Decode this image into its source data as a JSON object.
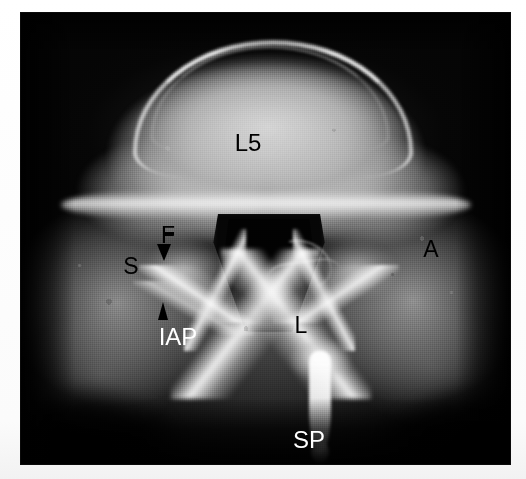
{
  "figure": {
    "kind": "axial-radiograph",
    "plate": {
      "background_color": "#050505",
      "page_color": "#ffffff",
      "left": 21,
      "top": 13,
      "width": 489,
      "height": 451
    }
  },
  "labels": [
    {
      "id": "l5",
      "text": "L5",
      "color": "#000000",
      "x": 248,
      "y": 143,
      "font_size": 24,
      "anchor": "center",
      "meaning": "fifth lumbar vertebral body"
    },
    {
      "id": "f",
      "text": "F",
      "color": "#000000",
      "x": 168,
      "y": 235,
      "font_size": 23,
      "anchor": "center",
      "meaning": "facet joint"
    },
    {
      "id": "s",
      "text": "S",
      "color": "#000000",
      "x": 131,
      "y": 266,
      "font_size": 23,
      "anchor": "center",
      "meaning": "superior articular process"
    },
    {
      "id": "a",
      "text": "A",
      "color": "#000000",
      "x": 431,
      "y": 249,
      "font_size": 23,
      "anchor": "center",
      "meaning": "ala of sacrum"
    },
    {
      "id": "l",
      "text": "L",
      "color": "#000000",
      "x": 301,
      "y": 325,
      "font_size": 23,
      "anchor": "center",
      "meaning": "lamina"
    },
    {
      "id": "iap",
      "text": "IAP",
      "color": "#ffffff",
      "x": 178,
      "y": 337,
      "font_size": 24,
      "anchor": "center",
      "meaning": "inferior articular process"
    },
    {
      "id": "sp",
      "text": "SP",
      "color": "#ffffff",
      "x": 309,
      "y": 440,
      "font_size": 24,
      "anchor": "center",
      "meaning": "spinous process"
    }
  ],
  "arrows": [
    {
      "id": "arrow-facet",
      "direction": "down",
      "color": "#000000",
      "x": 164,
      "y": 244,
      "points_to": "f"
    },
    {
      "id": "arrow-iap",
      "direction": "up",
      "color": "#000000",
      "x": 165,
      "y": 302,
      "points_to": "iap"
    }
  ],
  "anatomy_regions": [
    {
      "id": "vertebral-body",
      "label": "L5"
    },
    {
      "id": "spinal-canal",
      "label": ""
    },
    {
      "id": "facet-joint",
      "label": "F"
    },
    {
      "id": "superior-articular-process",
      "label": "S"
    },
    {
      "id": "sacral-ala",
      "label": "A"
    },
    {
      "id": "lamina",
      "label": "L"
    },
    {
      "id": "inferior-articular-process",
      "label": "IAP"
    },
    {
      "id": "spinous-process",
      "label": "SP"
    }
  ]
}
